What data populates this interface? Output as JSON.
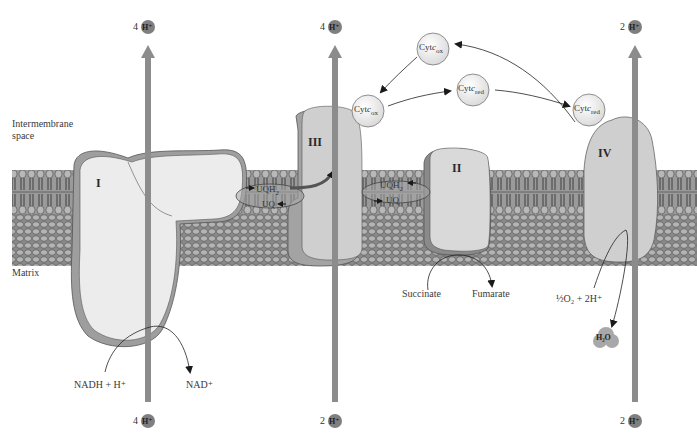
{
  "regions": {
    "intermembrane_line1": "Intermembrane",
    "intermembrane_line2": "space",
    "matrix": "Matrix"
  },
  "complexes": [
    {
      "id": "I",
      "label": "I"
    },
    {
      "id": "II",
      "label": "II"
    },
    {
      "id": "III",
      "label": "III"
    },
    {
      "id": "IV",
      "label": "IV"
    }
  ],
  "proton_pumps": [
    {
      "complex": "I",
      "top_count": "4",
      "bottom_count": "4",
      "ion": "H⁺"
    },
    {
      "complex": "III",
      "top_count": "4",
      "bottom_count": "2",
      "ion": "H⁺"
    },
    {
      "complex": "IV",
      "top_count": "2",
      "bottom_count": "2",
      "ion": "H⁺"
    }
  ],
  "cytochrome_c": [
    {
      "name": "Cyt c",
      "base": "Cyt",
      "italic": "c",
      "state": "ox",
      "position": "top"
    },
    {
      "name": "Cyt c",
      "base": "Cyt",
      "italic": "c",
      "state": "ox",
      "position": "near-III"
    },
    {
      "name": "Cyt c",
      "base": "Cyt",
      "italic": "c",
      "state": "red",
      "position": "middle"
    },
    {
      "name": "Cyt c",
      "base": "Cyt",
      "italic": "c",
      "state": "red",
      "position": "near-IV"
    }
  ],
  "ubiquinone": {
    "left": {
      "reduced": "UQH",
      "reduced_sub": "2",
      "oxidized": "UQ"
    },
    "right": {
      "reduced": "UQH",
      "reduced_sub": "2",
      "oxidized": "UQ"
    }
  },
  "reactions": {
    "complex_I_substrate": "NADH + H⁺",
    "complex_I_product": "NAD⁺",
    "complex_II_substrate": "Succinate",
    "complex_II_product": "Fumarate",
    "complex_IV_substrate": "½O₂ + 2H⁺",
    "complex_IV_product": "H₂O"
  },
  "colors": {
    "arrow_gray": "#8c8c8c",
    "proton_ball": "#7f7f7f",
    "complex_fill": "#d4d4d4",
    "complex_light": "#ebebeb",
    "complex_rim": "#9a9a9a",
    "membrane_dark": "#6d6d6d",
    "membrane_mid": "#a6a6a6"
  }
}
